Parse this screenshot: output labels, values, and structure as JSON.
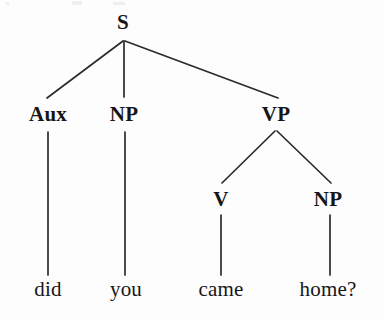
{
  "figure": {
    "kind": "syntax-tree",
    "sentence": "did you came home?",
    "background_color": "#fdfdfd",
    "ink_color": "#161616",
    "line_color": "#2b2b2b"
  },
  "nodes": {
    "s": {
      "label": "S",
      "x": 123,
      "y": 12
    },
    "aux": {
      "label": "Aux",
      "x": 48,
      "y": 104
    },
    "np1": {
      "label": "NP",
      "x": 124,
      "y": 104
    },
    "vp": {
      "label": "VP",
      "x": 276,
      "y": 104
    },
    "v": {
      "label": "V",
      "x": 221,
      "y": 189
    },
    "np2": {
      "label": "NP",
      "x": 328,
      "y": 189
    }
  },
  "leaves": {
    "did": {
      "label": "did",
      "x": 48,
      "y": 279
    },
    "you": {
      "label": "you",
      "x": 126,
      "y": 279
    },
    "came": {
      "label": "came",
      "x": 221,
      "y": 279
    },
    "home": {
      "label": "home?",
      "x": 328,
      "y": 279
    }
  },
  "edges": [
    {
      "name": "s-to-aux",
      "x1": 123,
      "y1": 41,
      "x2": 47,
      "y2": 98
    },
    {
      "name": "s-to-np1",
      "x1": 124,
      "y1": 41,
      "x2": 124,
      "y2": 97
    },
    {
      "name": "s-to-vp",
      "x1": 125,
      "y1": 41,
      "x2": 278,
      "y2": 98
    },
    {
      "name": "aux-to-did",
      "x1": 48,
      "y1": 132,
      "x2": 48,
      "y2": 275
    },
    {
      "name": "np1-to-you",
      "x1": 125,
      "y1": 132,
      "x2": 125,
      "y2": 275
    },
    {
      "name": "vp-to-v",
      "x1": 275,
      "y1": 131,
      "x2": 222,
      "y2": 183
    },
    {
      "name": "vp-to-np2",
      "x1": 277,
      "y1": 131,
      "x2": 331,
      "y2": 183
    },
    {
      "name": "v-to-came",
      "x1": 221,
      "y1": 215,
      "x2": 221,
      "y2": 275
    },
    {
      "name": "np2-to-home",
      "x1": 330,
      "y1": 215,
      "x2": 330,
      "y2": 275
    }
  ],
  "artifacts": [
    {
      "name": "scan-speck-1",
      "x": 6,
      "y": 2,
      "w": 3,
      "h": 3
    },
    {
      "name": "scan-speck-2",
      "x": 72,
      "y": 1,
      "w": 10,
      "h": 4
    },
    {
      "name": "scan-speck-3",
      "x": 113,
      "y": 2,
      "w": 12,
      "h": 3
    }
  ]
}
